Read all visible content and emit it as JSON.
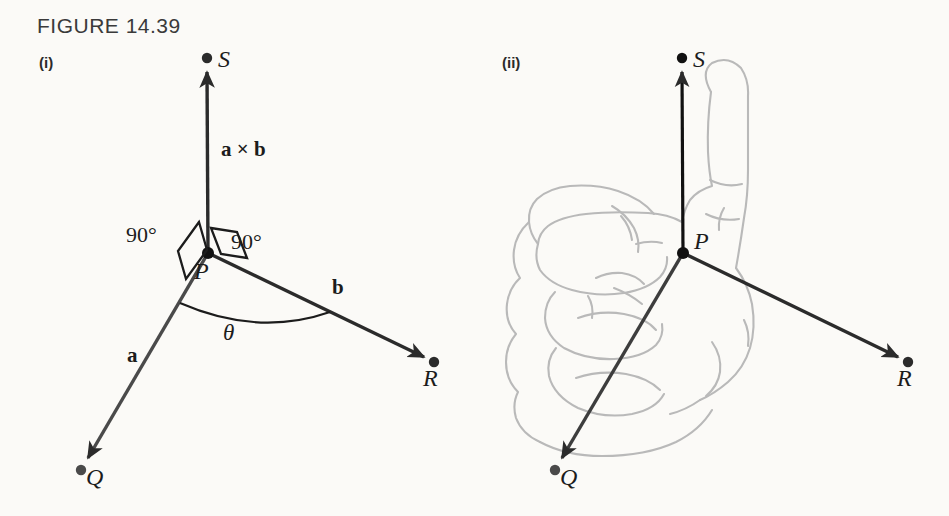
{
  "figure": {
    "title": "FIGURE 14.39",
    "background_color": "#fbfaf7",
    "ink_color": "#2b2b2b",
    "hand_color": "#b8b8b8"
  },
  "panels": [
    {
      "id": "i",
      "label": "(i)",
      "description": "Vector cross product diagram showing a x b perpendicular to both a and b",
      "points": [
        {
          "name": "P",
          "label": "P"
        },
        {
          "name": "Q",
          "label": "Q"
        },
        {
          "name": "R",
          "label": "R"
        },
        {
          "name": "S",
          "label": "S"
        }
      ],
      "vector_labels": [
        {
          "name": "cross-product",
          "text": "a × b"
        },
        {
          "name": "vector-a",
          "text": "a"
        },
        {
          "name": "vector-b",
          "text": "b"
        }
      ],
      "angle_labels": [
        {
          "name": "right-angle-left",
          "text": "90°"
        },
        {
          "name": "right-angle-right",
          "text": "90°"
        },
        {
          "name": "theta",
          "text": "θ"
        }
      ]
    },
    {
      "id": "ii",
      "label": "(ii)",
      "description": "Right-hand rule illustration: curled fingers from a to b, thumb points along a x b toward S",
      "points": [
        {
          "name": "P",
          "label": "P"
        },
        {
          "name": "Q",
          "label": "Q"
        },
        {
          "name": "R",
          "label": "R"
        },
        {
          "name": "S",
          "label": "S"
        }
      ]
    }
  ]
}
